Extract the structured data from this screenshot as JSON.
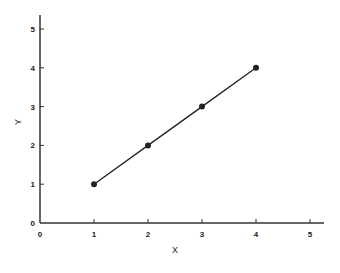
{
  "chart_data": {
    "type": "line",
    "title": "",
    "xlabel": "X",
    "ylabel": "Y",
    "xlim": [
      0,
      5
    ],
    "ylim": [
      0,
      5
    ],
    "x_ticks": [
      0,
      1,
      2,
      3,
      4,
      5
    ],
    "y_ticks": [
      0,
      1,
      2,
      3,
      4,
      5
    ],
    "grid": false,
    "legend": null,
    "series": [
      {
        "name": "series-1",
        "x": [
          1,
          2,
          3,
          4
        ],
        "y": [
          1,
          2,
          3,
          4
        ],
        "marker": "circle",
        "color": "#222222"
      }
    ]
  },
  "layout": {
    "origin_px": [
      40,
      223
    ],
    "unit_x_px": 54,
    "unit_y_px": 38.8,
    "x_axis_end_px": 324,
    "y_axis_top_px": 15
  }
}
